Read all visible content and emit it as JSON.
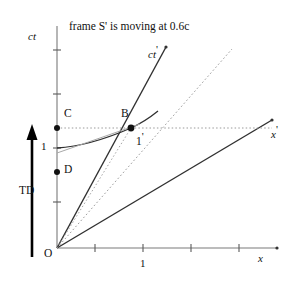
{
  "figure": {
    "title": "frame S' is moving at 0.6c",
    "velocity": "0.6c",
    "type": "minkowski-spacetime-diagram",
    "width": 295,
    "height": 281,
    "colors": {
      "line": "#2b2b2b",
      "axis": "#6e6e6e",
      "dotted": "#8c8c8c",
      "arrow": "#000000",
      "background": "#ffffff"
    }
  },
  "axes": {
    "ct": {
      "label": "ct",
      "label_x": 28,
      "label_y": 31
    },
    "x": {
      "label": "x",
      "label_x": 258,
      "label_y": 253
    },
    "ct_prime": {
      "label": "ct",
      "prime": "'",
      "label_x": 151,
      "label_y": 44
    },
    "x_prime": {
      "label": "x",
      "prime": "'",
      "label_x": 273,
      "label_y": 124
    },
    "origin": {
      "label": "O",
      "label_x": 44,
      "label_y": 250
    },
    "tick_x_one": {
      "label": "1",
      "label_x": 143,
      "label_y": 261
    },
    "tick_ct_one": {
      "label": "1",
      "label_x": 42,
      "label_y": 143
    }
  },
  "points": [
    {
      "name": "C",
      "label": "C",
      "label_x": 64,
      "label_y": 110,
      "cx": 57,
      "cy": 128
    },
    {
      "name": "B",
      "label": "B",
      "label_x": 122,
      "label_y": 110,
      "cx": 131,
      "cy": 128
    },
    {
      "name": "1p",
      "label": "1",
      "prime": "'",
      "label_x": 136,
      "label_y": 133
    },
    {
      "name": "D",
      "label": "D",
      "label_x": 64,
      "label_y": 166,
      "cx": 57,
      "cy": 172
    }
  ],
  "annotations": {
    "time_dilation": {
      "label": "TD",
      "label_x": 20,
      "label_y": 187
    },
    "td_arrow": {
      "x": 32,
      "y_bottom": 257,
      "y_top": 126
    }
  },
  "geometry": {
    "origin": [
      57,
      248
    ],
    "ct_axis_top": [
      57,
      26
    ],
    "x_axis_right": [
      277,
      248
    ],
    "ct_prime_end": [
      166,
      47
    ],
    "x_prime_end": [
      272,
      120
    ],
    "light_cone_end": [
      232,
      49
    ],
    "dotted_horizontal": {
      "y": 128,
      "x_from": 57,
      "x_to": 272
    },
    "dotted_from_origin_to_B": true,
    "hyperbola": {
      "from": [
        57,
        148
      ],
      "through": [
        131,
        128
      ]
    },
    "x_ticks": [
      95,
      143,
      191,
      239
    ],
    "ct_ticks": [
      202,
      148,
      94,
      50
    ]
  }
}
